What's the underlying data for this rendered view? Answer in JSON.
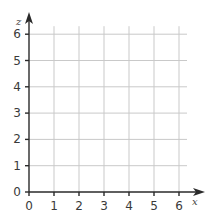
{
  "chart_data": {
    "type": "scatter",
    "title": "",
    "xlabel": "x",
    "ylabel": "z",
    "x_ticks": [
      "0",
      "1",
      "2",
      "3",
      "4",
      "5",
      "6"
    ],
    "y_ticks": [
      "0",
      "1",
      "2",
      "3",
      "4",
      "5",
      "6"
    ],
    "xlim": [
      0,
      6
    ],
    "ylim": [
      0,
      6
    ],
    "grid": true,
    "series": [],
    "legend": null,
    "note": "Empty coordinate grid (first quadrant) with arrowed x and z axes; no data plotted"
  },
  "axes": {
    "x_label": "x",
    "z_label": "z"
  },
  "colors": {
    "grid": "#c9c9c9",
    "axis": "#2a2a2a",
    "text": "#3a3a3a",
    "background": "#ffffff"
  }
}
